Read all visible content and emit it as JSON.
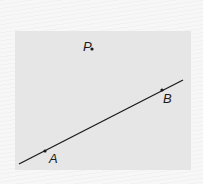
{
  "diagram": {
    "type": "geometry",
    "background_color": "#e6e6e6",
    "line": {
      "x1": 19,
      "y1": 164,
      "x2": 183,
      "y2": 80,
      "color": "#1a1a1a"
    },
    "points": [
      {
        "id": "A",
        "label": "A",
        "x": 45,
        "y": 151,
        "label_x": 49,
        "label_y": 163
      },
      {
        "id": "B",
        "label": "B",
        "x": 162,
        "y": 90,
        "label_x": 163,
        "label_y": 103
      },
      {
        "id": "P",
        "label": "P",
        "x": 92,
        "y": 49,
        "label_x": 83,
        "label_y": 51
      }
    ]
  }
}
